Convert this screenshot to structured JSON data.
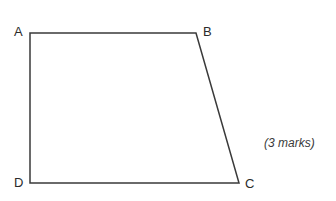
{
  "figure": {
    "type": "quadrilateral-diagram",
    "background_color": "#ffffff",
    "stroke_color": "#3a3a3a",
    "stroke_width": 1.5,
    "label_color": "#2b2b2b"
  },
  "vertices": [
    {
      "id": "A",
      "label": "A",
      "x": 30,
      "y": 33,
      "label_x": 14,
      "label_y": 25
    },
    {
      "id": "B",
      "label": "B",
      "x": 196,
      "y": 33,
      "label_x": 203,
      "label_y": 25
    },
    {
      "id": "C",
      "label": "C",
      "x": 239,
      "y": 183,
      "label_x": 245,
      "label_y": 177
    },
    {
      "id": "D",
      "label": "D",
      "x": 30,
      "y": 183,
      "label_x": 14,
      "label_y": 176
    }
  ],
  "edges": [
    {
      "from": "A",
      "to": "B"
    },
    {
      "from": "B",
      "to": "C"
    },
    {
      "from": "C",
      "to": "D"
    },
    {
      "from": "D",
      "to": "A"
    }
  ],
  "annotation": {
    "marks_text": "(3 marks)",
    "style": "italic",
    "color": "#3a3a3a"
  }
}
